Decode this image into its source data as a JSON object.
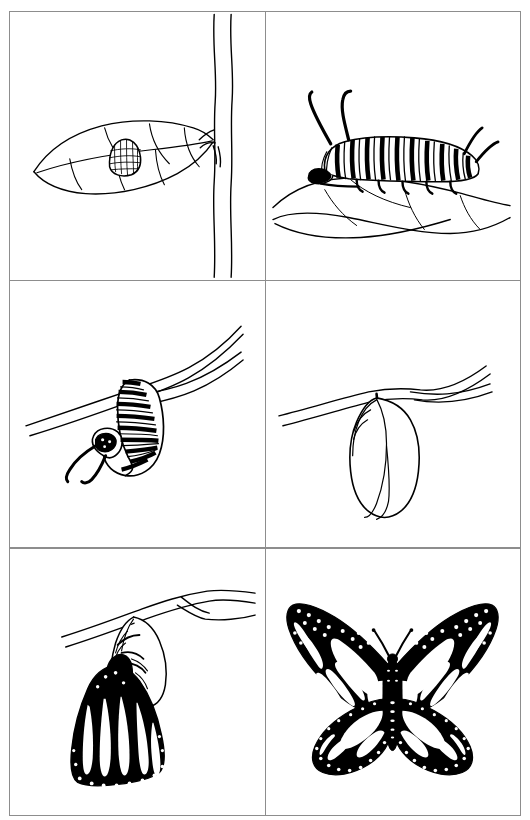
{
  "figure": {
    "style": "black and white line drawing",
    "layout": "2 columns x 3 rows grid of bordered panels",
    "background_color": "#ffffff",
    "ink_color": "#000000",
    "border_color": "#8d8d8d",
    "panel_count": 6
  },
  "panels": [
    {
      "index": "1",
      "position": "top-left",
      "stage": "Egg",
      "label": "Egg on milkweed leaf",
      "description": "A single ribbed monarch egg attached to the upper surface of a pointed leaf, the leaf joined by a short petiole to a tall vertical plant stem on the right side of the panel.",
      "elements": [
        "plant-stem",
        "leaf",
        "leaf-veins",
        "egg"
      ]
    },
    {
      "index": "2",
      "position": "top-right",
      "stage": "Larva",
      "label": "Striped caterpillar feeding on leaf",
      "description": "A banded monarch caterpillar with black, white and pale stripes rests on a broad leaf; two long black tentacles rise from behind the head and a shorter pair from the rear.",
      "elements": [
        "caterpillar",
        "head-tentacles",
        "tail-tentacles",
        "body-stripes",
        "prolegs",
        "leaf"
      ]
    },
    {
      "index": "3",
      "position": "middle-left",
      "stage": "Pre-pupa",
      "label": "Caterpillar hanging in a J shape from a twig",
      "description": "The striped caterpillar hangs upside down from a slender forked twig, its body curled into a J with the head end hanging free and its tentacles dangling.",
      "elements": [
        "twig",
        "twig-fork",
        "caterpillar",
        "j-curl",
        "tentacles"
      ]
    },
    {
      "index": "4",
      "position": "middle-right",
      "stage": "Pupa",
      "label": "Chrysalis suspended from a twig",
      "description": "A smooth teardrop-shaped chrysalis hangs by a black silk cremaster from a forked twig, with soft ridges near its top.",
      "elements": [
        "twig",
        "twig-fork",
        "cremaster",
        "chrysalis",
        "chrysalis-ridges"
      ]
    },
    {
      "index": "5",
      "position": "bottom-left",
      "stage": "Emergence",
      "label": "Adult butterfly emerging from the split chrysalis",
      "description": "A newly eclosed monarch clings to the empty, translucent chrysalis shell on a twig; its dark crumpled wings hang down, still limp and unexpanded, with white spots along the wing edges.",
      "elements": [
        "twig",
        "empty-chrysalis-shell",
        "emerging-butterfly",
        "crumpled-wings",
        "wing-spots",
        "legs"
      ]
    },
    {
      "index": "6",
      "position": "bottom-right",
      "stage": "Adult",
      "label": "Fully formed monarch butterfly with open wings",
      "description": "A monarch butterfly shown from above with wings fully spread, heavy black veins and borders, rows of white spots along the margins, a striped abdomen and two clubbed antennae.",
      "elements": [
        "forewings",
        "hindwings",
        "wing-veins",
        "white-margin-spots",
        "body",
        "abdomen",
        "antennae"
      ]
    }
  ]
}
